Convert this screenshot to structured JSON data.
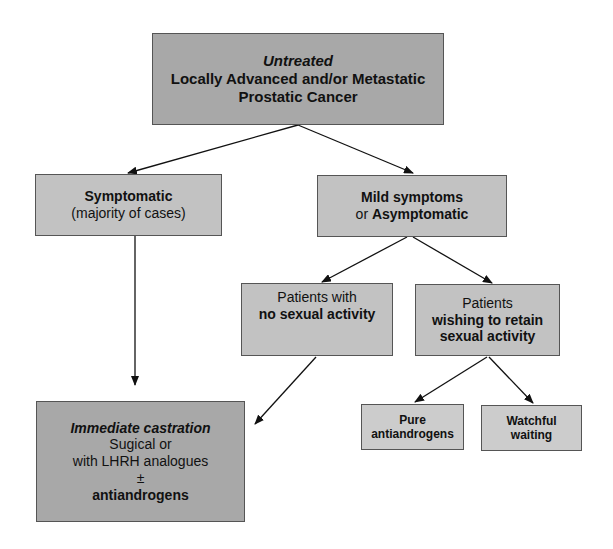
{
  "diagram": {
    "root": {
      "line1": "Untreated",
      "line2": "Locally Advanced  and/or Metastatic",
      "line3": "Prostatic Cancer"
    },
    "symptomatic": {
      "title": "Symptomatic",
      "subtitle": "(majority of cases)"
    },
    "mild": {
      "line1": "Mild symptoms",
      "line2_prefix": "or ",
      "line2_bold": "Asymptomatic"
    },
    "no_sexual": {
      "line1": "Patients with",
      "line2": "no sexual activity"
    },
    "retain_sexual": {
      "line1": "Patients",
      "line2": "wishing to  retain",
      "line3": "sexual activity"
    },
    "pure_antiandrogens": {
      "line1": "Pure",
      "line2": "antiandrogens"
    },
    "watchful_waiting": {
      "line1": "Watchful",
      "line2": "waiting"
    },
    "immediate_castration": {
      "title": "Immediate castration",
      "line2": "Sugical or",
      "line3": "with LHRH analogues",
      "line4": "±",
      "line5": "antiandrogens"
    },
    "colors": {
      "root_fill": "#a8a8a8",
      "node_fill": "#c2c2c2",
      "leaf_fill": "#cccccc",
      "border": "#555555",
      "arrow": "#111111"
    }
  }
}
